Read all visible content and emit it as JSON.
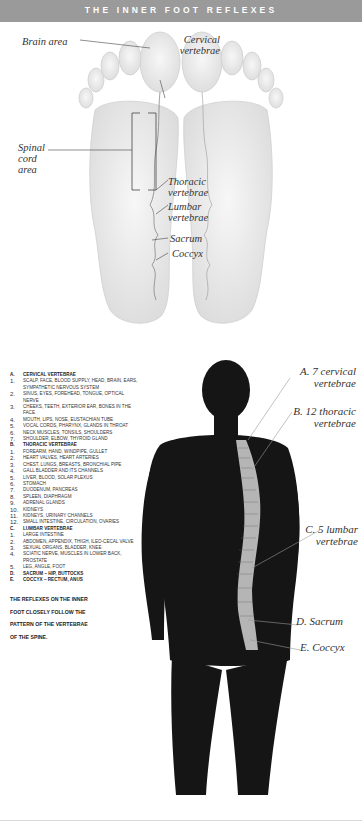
{
  "title": "THE INNER FOOT REFLEXES",
  "foot_labels": {
    "brain_area": "Brain area",
    "cervical": [
      "Cervical",
      "vertebrae"
    ],
    "spinal_cord": [
      "Spinal",
      "cord",
      "area"
    ],
    "thoracic": [
      "Thoracic",
      "vertebrae"
    ],
    "lumbar": [
      "Lumbar",
      "vertebrae"
    ],
    "sacrum": "Sacrum",
    "coccyx": "Coccyx"
  },
  "spine_labels": {
    "a": [
      "A. 7 cervical",
      "vertebrae"
    ],
    "b": [
      "B. 12 thoracic",
      "vertebrae"
    ],
    "c": [
      "C. 5 lumbar",
      "vertebrae"
    ],
    "d": "D. Sacrum",
    "e": "E. Coccyx"
  },
  "legend": [
    {
      "num": "A.",
      "text": "Cervical vertebrae",
      "header": true
    },
    {
      "num": "1.",
      "text": "Scalp, face, blood supply, head, brain, ears, sympathetic nervous system"
    },
    {
      "num": "2.",
      "text": "Sinus, eyes, forehead, tongue, optical nerve"
    },
    {
      "num": "3.",
      "text": "Cheeks, teeth, exterior ear, bones in the face"
    },
    {
      "num": "4.",
      "text": "Mouth, lips, nose, eustachian tube"
    },
    {
      "num": "5.",
      "text": "Vocal cords, pharynx, glands in throat"
    },
    {
      "num": "6.",
      "text": "Neck muscles, tonsils, shoulders"
    },
    {
      "num": "7.",
      "text": "Shoulder, elbow, thyroid gland"
    },
    {
      "num": "B.",
      "text": "Thoracic vertebrae",
      "header": true
    },
    {
      "num": "1.",
      "text": "Forearm, hand, windpipe, gullet"
    },
    {
      "num": "2.",
      "text": "Heart valves, heart arteries"
    },
    {
      "num": "3.",
      "text": "Chest, lungs, breasts, bronchial pipe"
    },
    {
      "num": "4.",
      "text": "Gall bladder and its channels"
    },
    {
      "num": "5.",
      "text": "Liver, blood, solar plexus"
    },
    {
      "num": "6.",
      "text": "Stomach"
    },
    {
      "num": "7.",
      "text": "Duodenum, pancreas"
    },
    {
      "num": "8.",
      "text": "Spleen, diaphragm"
    },
    {
      "num": "9.",
      "text": "Adrenal glands"
    },
    {
      "num": "10.",
      "text": "Kidneys"
    },
    {
      "num": "11.",
      "text": "Kidneys, urinary channels"
    },
    {
      "num": "12.",
      "text": "Small intestine, circulation, ovaries"
    },
    {
      "num": "C.",
      "text": "Lumbar vertebrae",
      "header": true
    },
    {
      "num": "1.",
      "text": "Large intestine"
    },
    {
      "num": "2.",
      "text": "Abdomen, appendix, thigh, ileo-cecal valve"
    },
    {
      "num": "3.",
      "text": "Sexual organs, bladder, knee"
    },
    {
      "num": "4.",
      "text": "Sciatic nerve, muscles in lower back, prostate"
    },
    {
      "num": "5.",
      "text": "Leg, angle, foot"
    },
    {
      "num": "D.",
      "text": "Sacrum – hip, buttocks",
      "header": true
    },
    {
      "num": "E.",
      "text": "Coccyx – rectum, anus",
      "header": true
    }
  ],
  "footer_text": "The reflexes on the inner foot closely follow the pattern of the vertebrae of the spine.",
  "colors": {
    "title_bar": "#9a9a9a",
    "foot": "#ececec",
    "body": "#151515",
    "spine": "#b5b5b5"
  }
}
